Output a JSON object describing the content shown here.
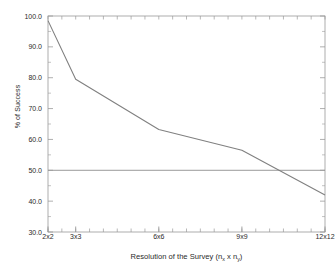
{
  "chart_data": {
    "type": "line",
    "title": "",
    "xlabel": "Resolution of the Survey (n_x x n_y)",
    "xlabel_parts": {
      "prefix": "Resolution of the Survey (n",
      "sub1": "x",
      "middle": " x n",
      "sub2": "y",
      "suffix": ")"
    },
    "ylabel": "% of Success",
    "categories": [
      "2x2",
      "3x3",
      "6x6",
      "9x9",
      "12x12"
    ],
    "x": [
      2,
      3,
      6,
      9,
      12
    ],
    "values": [
      98.5,
      79.5,
      63.2,
      56.5,
      42.0
    ],
    "xlim": [
      2,
      12
    ],
    "ylim": [
      30.0,
      100.0
    ],
    "yticks": [
      "100.0",
      "90.0",
      "80.0",
      "70.0",
      "60.0",
      "50.0",
      "40.0",
      "30.0"
    ],
    "ytick_values": [
      100.0,
      90.0,
      80.0,
      70.0,
      60.0,
      50.0,
      40.0,
      30.0
    ],
    "xtick_labels": [
      "2x2",
      "3x3",
      "6x6",
      "9x9",
      "12x12"
    ],
    "xtick_values": [
      2,
      3,
      6,
      9,
      12
    ],
    "grid": false,
    "legend": "none",
    "series": [
      {
        "name": "% of Success",
        "values": [
          98.5,
          79.5,
          63.2,
          56.5,
          42.0
        ],
        "color": "#808080"
      }
    ],
    "reference_lines": [
      {
        "name": "50 percent threshold",
        "orientation": "horizontal",
        "value": 50.0,
        "color": "#9a9a9a"
      }
    ],
    "colors": {
      "line": "#7f7f7f",
      "reference_line": "#9a9a9a",
      "axis": "#9a9a9a",
      "text": "#2b2b2b",
      "background": "#ffffff"
    }
  }
}
